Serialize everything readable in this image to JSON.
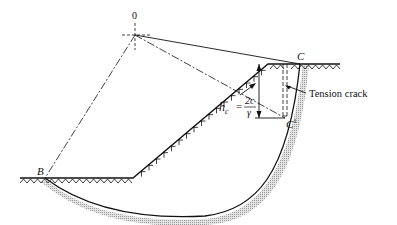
{
  "figure": {
    "labels": {
      "center": "0",
      "point_top": "C",
      "point_crack_bottom": "C",
      "point_crack_bottom_sup": "1",
      "point_toe": "B",
      "tension_crack": "Tension crack",
      "hc_symbol": "h",
      "hc_subscript": "c",
      "equals": "=",
      "numerator": "2c",
      "denominator": "γ"
    },
    "colors": {
      "line": "#111111",
      "shade": "#bdbdbd"
    }
  }
}
